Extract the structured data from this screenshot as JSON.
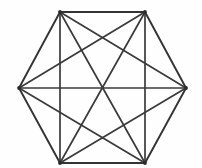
{
  "figure": {
    "background_color": "#fefefe",
    "line_color": "#3a3a3a",
    "perimeter_color": "#333333",
    "vertex_color": "#2b2b2b",
    "stroke_width": 1.7,
    "vertex_count": 6,
    "edge_count": 15,
    "canvas": {
      "width": 202,
      "height": 168
    }
  },
  "chart_data": {
    "type": "scatter",
    "xlabel": "",
    "ylabel": "",
    "xlim": [
      0,
      202
    ],
    "ylim": [
      0,
      168
    ],
    "grid": false,
    "legend": null,
    "vertices": [
      {
        "id": "A",
        "label": "top-left",
        "x": 60,
        "y": 12
      },
      {
        "id": "B",
        "label": "top-right",
        "x": 145,
        "y": 12
      },
      {
        "id": "C",
        "label": "right",
        "x": 186,
        "y": 88
      },
      {
        "id": "D",
        "label": "bottom-right",
        "x": 145,
        "y": 163
      },
      {
        "id": "E",
        "label": "bottom-left",
        "x": 60,
        "y": 163
      },
      {
        "id": "F",
        "label": "left",
        "x": 19,
        "y": 88
      }
    ],
    "edges": [
      {
        "from": "A",
        "to": "B",
        "kind": "perimeter"
      },
      {
        "from": "B",
        "to": "C",
        "kind": "perimeter"
      },
      {
        "from": "C",
        "to": "D",
        "kind": "perimeter"
      },
      {
        "from": "D",
        "to": "E",
        "kind": "perimeter"
      },
      {
        "from": "E",
        "to": "F",
        "kind": "perimeter"
      },
      {
        "from": "F",
        "to": "A",
        "kind": "perimeter"
      },
      {
        "from": "A",
        "to": "C",
        "kind": "short-diagonal"
      },
      {
        "from": "A",
        "to": "D",
        "kind": "long-diagonal"
      },
      {
        "from": "A",
        "to": "E",
        "kind": "short-diagonal"
      },
      {
        "from": "B",
        "to": "D",
        "kind": "short-diagonal"
      },
      {
        "from": "B",
        "to": "E",
        "kind": "long-diagonal"
      },
      {
        "from": "B",
        "to": "F",
        "kind": "short-diagonal"
      },
      {
        "from": "C",
        "to": "E",
        "kind": "short-diagonal"
      },
      {
        "from": "C",
        "to": "F",
        "kind": "long-diagonal"
      },
      {
        "from": "D",
        "to": "F",
        "kind": "short-diagonal"
      }
    ]
  }
}
